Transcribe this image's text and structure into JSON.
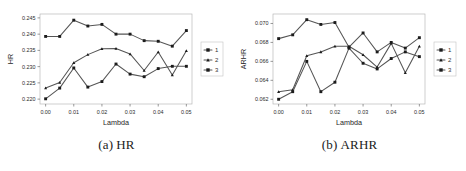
{
  "figure": {
    "panels": [
      {
        "id": "panel-a",
        "caption_tag": "(a)",
        "caption_text": "HR"
      },
      {
        "id": "panel-b",
        "caption_tag": "(b)",
        "caption_text": "ARHR"
      }
    ]
  },
  "chart_data": [
    {
      "type": "line",
      "title": "",
      "xlabel": "Lambda",
      "ylabel": "HR",
      "x": [
        0.0,
        0.005,
        0.01,
        0.015,
        0.02,
        0.025,
        0.03,
        0.035,
        0.04,
        0.045,
        0.05
      ],
      "xlim": [
        -0.002,
        0.052
      ],
      "ylim": [
        0.2185,
        0.2462
      ],
      "xticks": [
        0.0,
        0.01,
        0.02,
        0.03,
        0.04,
        0.05
      ],
      "xticklabels": [
        "0.00",
        "0.01",
        "0.02",
        "0.03",
        "0.04",
        "0.05"
      ],
      "yticks": [
        0.22,
        0.225,
        0.23,
        0.235,
        0.24,
        0.245
      ],
      "yticklabels": [
        "0.220",
        "0.225",
        "0.230",
        "0.235",
        "0.240",
        "0.245"
      ],
      "grid": false,
      "legend_position": "right-outside",
      "series": [
        {
          "name": "1",
          "marker": "square",
          "values": [
            0.2393,
            0.2393,
            0.2443,
            0.2425,
            0.243,
            0.24,
            0.24,
            0.238,
            0.2378,
            0.2363,
            0.2411
          ]
        },
        {
          "name": "2",
          "marker": "triangle",
          "values": [
            0.2234,
            0.2251,
            0.2312,
            0.2337,
            0.2355,
            0.2356,
            0.2339,
            0.2288,
            0.2345,
            0.2274,
            0.2349
          ]
        },
        {
          "name": "3",
          "marker": "square",
          "values": [
            0.2201,
            0.2234,
            0.2296,
            0.2237,
            0.2254,
            0.2308,
            0.2277,
            0.2269,
            0.2294,
            0.2301,
            0.2301
          ]
        }
      ]
    },
    {
      "type": "line",
      "title": "",
      "xlabel": "Lambda",
      "ylabel": "ARHR",
      "x": [
        0.0,
        0.005,
        0.01,
        0.015,
        0.02,
        0.025,
        0.03,
        0.035,
        0.04,
        0.045,
        0.05
      ],
      "xlim": [
        -0.002,
        0.052
      ],
      "ylim": [
        0.0615,
        0.071
      ],
      "xticks": [
        0.0,
        0.01,
        0.02,
        0.03,
        0.04,
        0.05
      ],
      "xticklabels": [
        "0.00",
        "0.01",
        "0.02",
        "0.03",
        "0.04",
        "0.05"
      ],
      "yticks": [
        0.062,
        0.064,
        0.066,
        0.068,
        0.07
      ],
      "yticklabels": [
        "0.062",
        "0.064",
        "0.066",
        "0.068",
        "0.070"
      ],
      "grid": false,
      "legend_position": "right-outside",
      "series": [
        {
          "name": "1",
          "marker": "square",
          "values": [
            0.0684,
            0.0688,
            0.0704,
            0.0699,
            0.0701,
            0.0675,
            0.069,
            0.067,
            0.068,
            0.0674,
            0.0685
          ]
        },
        {
          "name": "2",
          "marker": "triangle",
          "values": [
            0.0628,
            0.063,
            0.0666,
            0.067,
            0.0676,
            0.0676,
            0.0667,
            0.0654,
            0.0679,
            0.0648,
            0.0676
          ]
        },
        {
          "name": "3",
          "marker": "square",
          "values": [
            0.062,
            0.0628,
            0.066,
            0.0628,
            0.0638,
            0.0674,
            0.0658,
            0.0652,
            0.0663,
            0.067,
            0.0665
          ]
        }
      ]
    }
  ],
  "legend": {
    "entries": [
      {
        "label": "1"
      },
      {
        "label": "2"
      },
      {
        "label": "3"
      }
    ]
  },
  "colors": {
    "line": "#555555",
    "marker": "#1c1c1c",
    "frame": "#b9b9b9",
    "text": "#2a2a2a",
    "background": "#ffffff"
  }
}
